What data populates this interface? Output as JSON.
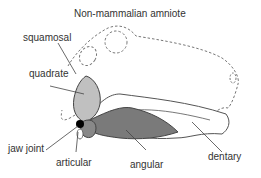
{
  "title": "Non-mammalian amniote",
  "labels": {
    "squamosal": "squamosal",
    "quadrate": "quadrate",
    "jaw_joint": "jaw joint",
    "articular": "articular",
    "angular": "angular",
    "dentary": "dentary"
  },
  "colors": {
    "quadrate_fill": "#c0c0c0",
    "angular_fill": "#7a7a7a",
    "articular_fill": "#888888",
    "jaw_joint": "#000000",
    "outline": "#555555",
    "dashed": "#777777"
  }
}
